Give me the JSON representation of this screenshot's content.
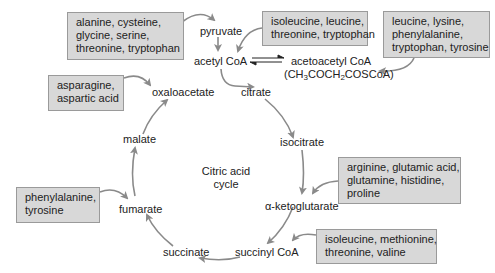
{
  "diagram": {
    "title": "Citric acid cycle",
    "center_label": [
      "Citric acid",
      "cycle"
    ],
    "nodes": {
      "pyruvate": "pyruvate",
      "acetyl_coa": "acetyl CoA",
      "acetoacetyl_coa": "acetoacetyl CoA",
      "acetoacetyl_formula_parts": [
        "(CH",
        "3",
        "COCH",
        "2",
        "COSCoA)"
      ],
      "citrate": "citrate",
      "isocitrate": "isocitrate",
      "alpha_ketoglutarate": "α-ketoglutarate",
      "succinyl_coa": "succinyl CoA",
      "succinate": "succinate",
      "fumarate": "fumarate",
      "malate": "malate",
      "oxaloacetate": "oxaloacetate"
    },
    "amino_acid_boxes": [
      {
        "id": "to-pyruvate",
        "lines": [
          "alanine, cysteine,",
          "glycine, serine,",
          "threonine, tryptophan"
        ]
      },
      {
        "id": "to-acetyl-coa",
        "lines": [
          "isoleucine, leucine,",
          "threonine, tryptophan"
        ]
      },
      {
        "id": "to-acetoacetyl-coa",
        "lines": [
          "leucine, lysine,",
          "phenylalanine,",
          "tryptophan, tyrosine"
        ]
      },
      {
        "id": "to-oxaloacetate",
        "lines": [
          "asparagine,",
          "aspartic acid"
        ]
      },
      {
        "id": "to-alpha-ketoglutarate",
        "lines": [
          "arginine, glutamic acid,",
          "glutamine, histidine,",
          "proline"
        ]
      },
      {
        "id": "to-succinyl-coa",
        "lines": [
          "isoleucine, methionine,",
          "threonine, valine"
        ]
      },
      {
        "id": "to-fumarate",
        "lines": [
          "phenylalanine,",
          "tyrosine"
        ]
      }
    ],
    "colors": {
      "box_fill": "#d8d8d8",
      "box_border": "#9a9a9a",
      "arrow": "#8a8a8a",
      "text": "#222222"
    }
  }
}
